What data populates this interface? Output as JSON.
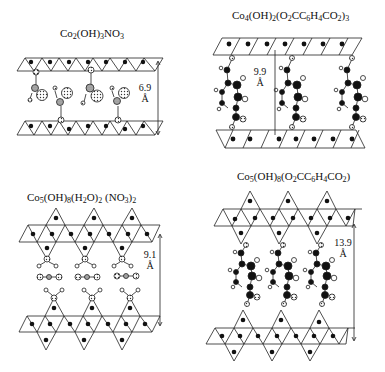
{
  "panels": [
    {
      "id": "cobalt-hydroxide-nitrate",
      "title": {
        "base": [
          "Co",
          "(OH)",
          "NO"
        ],
        "subs": [
          "2",
          "3",
          "3"
        ]
      },
      "title_text": "Co2(OH)3NO3",
      "spacing": {
        "value": "6.9",
        "unit": "Å"
      },
      "interlayer_species": "nitrate"
    },
    {
      "id": "cobalt-hydroxide-terephthalate-4",
      "title": {
        "base": [
          "Co",
          "(OH)",
          "(O",
          "CC",
          "H",
          "CO",
          ")"
        ],
        "subs": [
          "4",
          "2",
          "2",
          "6",
          "4",
          "2",
          "3"
        ]
      },
      "title_text": "Co4(OH)2(O2CC6H4CO2)3",
      "spacing": {
        "value": "9.9",
        "unit": "Å"
      },
      "interlayer_species": "terephthalate"
    },
    {
      "id": "cobalt-hydroxide-aqua-nitrate",
      "title": {
        "base": [
          "Co",
          "(OH)",
          "(H",
          "O)",
          " (NO",
          ")"
        ],
        "subs": [
          "5",
          "8",
          "2",
          "2",
          "3",
          "2"
        ]
      },
      "title_text": "Co5(OH)8(H2O)2 (NO3)2",
      "spacing": {
        "value": "9.1",
        "unit": "Å"
      },
      "interlayer_species": "nitrate + water"
    },
    {
      "id": "cobalt-hydroxide-terephthalate-5",
      "title": {
        "base": [
          "Co",
          "(OH)",
          "(O",
          "CC",
          "H",
          "CO",
          ")"
        ],
        "subs": [
          "5",
          "8",
          "2",
          "6",
          "4",
          "2",
          ""
        ]
      },
      "title_text": "Co5(OH)8(O2CC6H4CO2)",
      "spacing": {
        "value": "13.9",
        "unit": "Å"
      },
      "interlayer_species": "terephthalate"
    }
  ],
  "colors": {
    "ink": "#111111",
    "background": "#ffffff",
    "shaded_atom": "#8a8a8a"
  }
}
